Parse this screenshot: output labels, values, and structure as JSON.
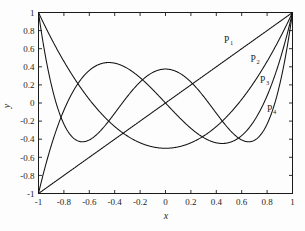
{
  "figure": {
    "background_color": "#fdfdfd",
    "line_color": "#121212",
    "axis_color": "#1a1a1a"
  },
  "axes": {
    "x_title": "x",
    "y_title": "y"
  },
  "chart_data": {
    "type": "line",
    "title": "",
    "subtitle": "",
    "xlabel": "x",
    "ylabel": "y",
    "xlim": [
      -1,
      1
    ],
    "ylim": [
      -1,
      1
    ],
    "grid": false,
    "legend_position": "inline-curve-labels",
    "x_ticks": [
      "-1",
      "-0.8",
      "-0.6",
      "-0.4",
      "-0.2",
      "0",
      "0.2",
      "0.4",
      "0.6",
      "0.8",
      "1"
    ],
    "x_tick_values": [
      -1,
      -0.8,
      -0.6,
      -0.4,
      -0.2,
      0,
      0.2,
      0.4,
      0.6,
      0.8,
      1
    ],
    "y_ticks": [
      "1",
      "0.8",
      "0.6",
      "0.4",
      "0.2",
      "0",
      "-0.2",
      "-0.4",
      "-0.6",
      "-0.8",
      "-1"
    ],
    "y_tick_values": [
      1,
      0.8,
      0.6,
      0.4,
      0.2,
      0,
      -0.2,
      -0.4,
      -0.6,
      -0.8,
      -1
    ],
    "x": [
      -1,
      -0.95,
      -0.9,
      -0.85,
      -0.8,
      -0.75,
      -0.7,
      -0.65,
      -0.6,
      -0.55,
      -0.5,
      -0.45,
      -0.4,
      -0.35,
      -0.3,
      -0.25,
      -0.2,
      -0.15,
      -0.1,
      -0.05,
      0,
      0.05,
      0.1,
      0.15,
      0.2,
      0.25,
      0.3,
      0.35,
      0.4,
      0.45,
      0.5,
      0.55,
      0.6,
      0.65,
      0.7,
      0.75,
      0.8,
      0.85,
      0.9,
      0.95,
      1
    ],
    "series": [
      {
        "name": "P1",
        "label": "P",
        "subscript": "1",
        "formula": "x",
        "values": [
          -1,
          -0.95,
          -0.9,
          -0.85,
          -0.8,
          -0.75,
          -0.7,
          -0.65,
          -0.6,
          -0.55,
          -0.5,
          -0.45,
          -0.4,
          -0.35,
          -0.3,
          -0.25,
          -0.2,
          -0.15,
          -0.1,
          -0.05,
          0,
          0.05,
          0.1,
          0.15,
          0.2,
          0.25,
          0.3,
          0.35,
          0.4,
          0.45,
          0.5,
          0.55,
          0.6,
          0.65,
          0.7,
          0.75,
          0.8,
          0.85,
          0.9,
          0.95,
          1
        ],
        "label_x": 0.46,
        "label_y": 0.665
      },
      {
        "name": "P2",
        "label": "P",
        "subscript": "2",
        "formula": "(3x^2 - 1)/2",
        "values": [
          1,
          0.85375,
          0.715,
          0.58375,
          0.46,
          0.34375,
          0.235,
          0.13375,
          0.04,
          -0.04625,
          -0.125,
          -0.19625,
          -0.26,
          -0.31625,
          -0.365,
          -0.40625,
          -0.44,
          -0.46625,
          -0.485,
          -0.49625,
          -0.5,
          -0.49625,
          -0.485,
          -0.46625,
          -0.44,
          -0.40625,
          -0.365,
          -0.31625,
          -0.26,
          -0.19625,
          -0.125,
          -0.04625,
          0.04,
          0.13375,
          0.235,
          0.34375,
          0.46,
          0.58375,
          0.715,
          0.85375,
          1
        ],
        "label_x": 0.67,
        "label_y": 0.455
      },
      {
        "name": "P3",
        "label": "P",
        "subscript": "3",
        "formula": "(5x^3 - 3x)/2",
        "values": [
          -1,
          -0.7006,
          -0.4275,
          -0.1809,
          0.04,
          0.2344,
          0.4025,
          0.5444,
          0.66,
          0.7494,
          0.8125,
          0.8494,
          0.86,
          0.8444,
          0.8025,
          0.7344,
          0.64,
          0.5194,
          0.3725,
          0.1994,
          0,
          -0.1994,
          -0.3725,
          -0.5194,
          -0.64,
          -0.7344,
          -0.8025,
          -0.8444,
          -0.86,
          -0.8494,
          -0.8125,
          -0.7494,
          -0.66,
          -0.5444,
          -0.4025,
          -0.2344,
          -0.04,
          0.1809,
          0.4275,
          0.7006,
          1
        ],
        "label_x": 0.745,
        "label_y": 0.225
      },
      {
        "name": "P4",
        "label": "P",
        "subscript": "4",
        "formula": "(35x^4 - 30x^2 + 3)/8",
        "values": [
          1,
          0.6266,
          0.3079,
          0.0411,
          -0.178,
          -0.3535,
          -0.4897,
          -0.5906,
          -0.6601,
          -0.7022,
          -0.7109,
          -0.7109,
          -0.7,
          -0.6707,
          -0.6267,
          -0.5701,
          -0.5031,
          -0.428,
          -0.3471,
          -0.2631,
          -0.1781,
          -0.0948,
          -0.0155,
          0.0573,
          0.1211,
          0.1733,
          0.2119,
          0.2341,
          0.2375,
          0.2197,
          0.1777,
          0.1086,
          0.0094,
          -0.1224,
          -0.2881,
          -0.4875,
          -0.7184,
          -0.9765,
          -1.2531,
          -1.5336,
          1
        ],
        "label_x": 0.8,
        "label_y": -0.1
      }
    ],
    "annotations": [
      {
        "text": "P1",
        "note": "curve label for Legendre polynomial of degree 1"
      },
      {
        "text": "P2",
        "note": "curve label for Legendre polynomial of degree 2"
      },
      {
        "text": "P3",
        "note": "curve label for Legendre polynomial of degree 3"
      },
      {
        "text": "P4",
        "note": "curve label for Legendre polynomial of degree 4"
      }
    ]
  }
}
